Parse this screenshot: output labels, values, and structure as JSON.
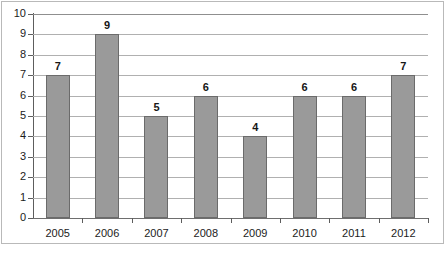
{
  "chart_data": {
    "type": "bar",
    "title": "",
    "subtitle": "",
    "xlabel": "",
    "ylabel": "",
    "categories": [
      "2005",
      "2006",
      "2007",
      "2008",
      "2009",
      "2010",
      "2011",
      "2012"
    ],
    "values": [
      7,
      9,
      5,
      6,
      4,
      6,
      6,
      7
    ],
    "data_labels": [
      "7",
      "9",
      "5",
      "6",
      "4",
      "6",
      "6",
      "7"
    ],
    "ylim": [
      0,
      10
    ],
    "y_ticks": [
      0,
      1,
      2,
      3,
      4,
      5,
      6,
      7,
      8,
      9,
      10
    ],
    "y_tick_labels": [
      "0",
      "1",
      "2",
      "3",
      "4",
      "5",
      "6",
      "7",
      "8",
      "9",
      "10"
    ],
    "grid": true,
    "grid_axis": "y",
    "legend": false,
    "legend_position": "none",
    "annotations": [],
    "colors": {
      "bar_fill": "#9a9a9a",
      "bar_border": "#6b6b6b",
      "gridline": "#b0b0b0",
      "axis": "#5d5d5d",
      "frame": "#b9b9b9",
      "background": "#ffffff",
      "text": "#1b1b1b"
    }
  }
}
